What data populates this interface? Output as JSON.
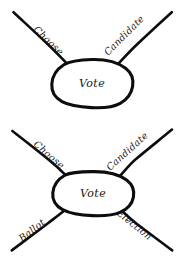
{
  "canvas": {
    "width": 184,
    "height": 261,
    "background": "#ffffff",
    "ink_color": "#0d0d0d",
    "text_color": "#171717",
    "style": "hand-drawn-sketch"
  },
  "diagrams": [
    {
      "id": "diagram-top",
      "name": "vote-two-spoke-diagram",
      "center": {
        "label": "Vote",
        "shape": "ellipse",
        "cx": 92,
        "cy": 83,
        "rx": 40,
        "ry": 24
      },
      "spokes": [
        {
          "label": "Choose",
          "position": "upper-left",
          "angle_deg": -152,
          "x1": 13,
          "y1": 12,
          "x2": 66,
          "y2": 63
        },
        {
          "label": "Candidate",
          "position": "upper-right",
          "angle_deg": -28,
          "x1": 172,
          "y1": 12,
          "x2": 119,
          "y2": 63
        }
      ]
    },
    {
      "id": "diagram-bottom",
      "name": "vote-four-spoke-diagram",
      "center": {
        "label": "Vote",
        "shape": "ellipse",
        "cx": 93,
        "cy": 193,
        "rx": 40,
        "ry": 22
      },
      "spokes": [
        {
          "label": "Choose",
          "position": "upper-left",
          "angle_deg": -145,
          "x1": 12,
          "y1": 131,
          "x2": 66,
          "y2": 176
        },
        {
          "label": "Candidate",
          "position": "upper-right",
          "angle_deg": -35,
          "x1": 172,
          "y1": 130,
          "x2": 120,
          "y2": 176
        },
        {
          "label": "Ballot",
          "position": "lower-left",
          "angle_deg": 145,
          "x1": 12,
          "y1": 250,
          "x2": 66,
          "y2": 209
        },
        {
          "label": "Election",
          "position": "lower-right",
          "angle_deg": 35,
          "x1": 172,
          "y1": 250,
          "x2": 120,
          "y2": 209
        }
      ]
    }
  ]
}
